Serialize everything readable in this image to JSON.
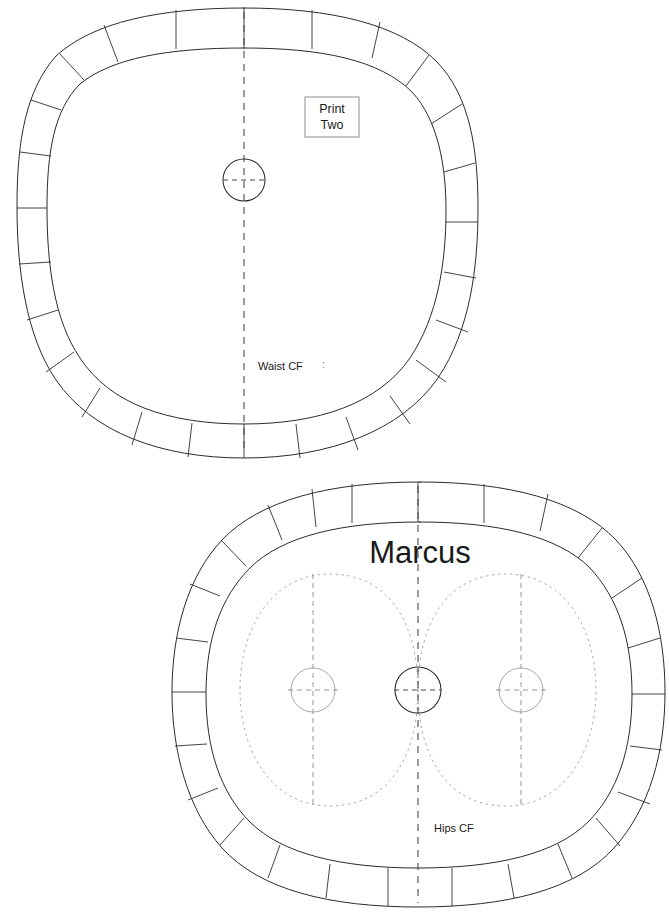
{
  "document": {
    "kind": "sewing-pattern-sheet",
    "background_color": "#ffffff",
    "ink_color": "#2b2b2b",
    "light_ink_color": "#9a9a9a",
    "dashed_ink_color": "#4a4a4a",
    "width": 669,
    "height": 915
  },
  "pieces": [
    {
      "id": "upper-piece",
      "name": "waist-pattern-piece",
      "print_box": {
        "line1": "Print",
        "line2": "Two"
      },
      "center_front_label": "Waist CF",
      "tick_after_label": ":",
      "notch_count": 28,
      "circle_count": 1,
      "has_overlay_curves": false,
      "bounds": {
        "x": 10,
        "y": 8,
        "width": 468,
        "height": 452
      }
    },
    {
      "id": "lower-piece",
      "name": "hips-pattern-piece",
      "title": "Marcus",
      "center_front_label": "Hips CF",
      "notch_count": 28,
      "circle_count": 3,
      "has_overlay_curves": true,
      "bounds": {
        "x": 172,
        "y": 482,
        "width": 493,
        "height": 425
      }
    }
  ],
  "labels": {
    "print_line1": "Print",
    "print_line2": "Two",
    "waist_cf": "Waist CF",
    "waist_tick": ":",
    "marcus_title": "Marcus",
    "hips_cf": "Hips CF"
  }
}
